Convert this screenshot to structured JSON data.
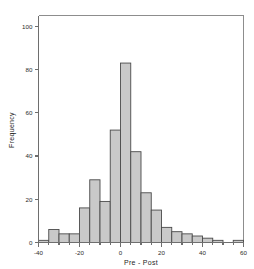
{
  "chart_data": {
    "type": "bar",
    "subtype": "histogram",
    "title": "",
    "xlabel": "Pre - Post",
    "ylabel": "Frequency",
    "xlim": [
      -40,
      60
    ],
    "ylim": [
      0,
      105
    ],
    "bin_width": 5,
    "grid": false,
    "legend": null,
    "xticks": [
      -40,
      -20,
      0,
      20,
      40,
      60
    ],
    "xtick_labels": [
      "-40",
      "-20",
      "0",
      "20",
      "40",
      "60"
    ],
    "yticks": [
      0,
      20,
      40,
      60,
      80,
      100
    ],
    "ytick_labels": [
      "0",
      "20",
      "40",
      "60",
      "80",
      "100"
    ],
    "xminor_step": 5,
    "bin_edges": [
      -40,
      -35,
      -30,
      -25,
      -20,
      -15,
      -10,
      -5,
      0,
      5,
      10,
      15,
      20,
      25,
      30,
      35,
      40,
      45,
      50,
      55,
      60
    ],
    "bin_centers": [
      -37.5,
      -32.5,
      -27.5,
      -22.5,
      -17.5,
      -12.5,
      -7.5,
      -2.5,
      2.5,
      7.5,
      12.5,
      17.5,
      22.5,
      27.5,
      32.5,
      37.5,
      42.5,
      47.5,
      52.5,
      57.5
    ],
    "categories": [
      "-40 to -35",
      "-35 to -30",
      "-30 to -25",
      "-25 to -20",
      "-20 to -15",
      "-15 to -10",
      "-10 to -5",
      "-5 to 0",
      "0 to 5",
      "5 to 10",
      "10 to 15",
      "15 to 20",
      "20 to 25",
      "25 to 30",
      "30 to 35",
      "35 to 40",
      "40 to 45",
      "45 to 50",
      "50 to 55",
      "55 to 60"
    ],
    "values": [
      1,
      6,
      4,
      4,
      16,
      29,
      19,
      52,
      83,
      42,
      23,
      15,
      7,
      5,
      4,
      3,
      2,
      1,
      0,
      1
    ],
    "bar_fill": "#c9c9c9",
    "bar_edge": "#4a4a4a",
    "axis_color": "#6e6e6e",
    "text_color": "#1f1f1f"
  }
}
